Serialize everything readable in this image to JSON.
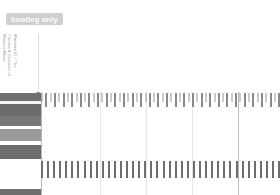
{
  "badge": {
    "label": "bootleg only",
    "bg_color": "#cfcfcf",
    "text_color": "#ffffff"
  },
  "event": {
    "line1": "Machina #1 / The",
    "line2": "Friends & Enemies of",
    "line3": "Modern Music",
    "stem_color": "#dcdcdc",
    "marker_color": "#9e9e9e"
  },
  "palette": {
    "background": "#ffffff",
    "gridline": "#e6e6e6",
    "gridline_major": "#b8b8b8",
    "tick_dark": "#6e6e6e",
    "tick_mid": "#9a9a9a",
    "tick_light": "#c8c8c8"
  },
  "swatches": [
    {
      "name": "swatch-1",
      "color": "#6f6f6f",
      "height": 8
    },
    {
      "name": "swatch-2",
      "color": "#f4f4f4",
      "height": 3
    },
    {
      "name": "swatch-3",
      "color": "#6b6b6b",
      "height": 12
    },
    {
      "name": "swatch-4",
      "color": "#777777",
      "height": 10
    },
    {
      "name": "swatch-5",
      "color": "#ffffff",
      "height": 3
    },
    {
      "name": "swatch-6",
      "color": "#9a9a9a",
      "height": 12
    },
    {
      "name": "swatch-7",
      "color": "#ffffff",
      "height": 4
    },
    {
      "name": "swatch-8",
      "color": "#6e6e6e",
      "height": 14
    },
    {
      "name": "swatch-9",
      "color": "#ffffff",
      "height": 30
    },
    {
      "name": "swatch-10",
      "color": "#6e6e6e",
      "height": 16
    }
  ],
  "gridlines": [
    {
      "x": 41,
      "major": true
    },
    {
      "x": 100,
      "major": false
    },
    {
      "x": 146,
      "major": false
    },
    {
      "x": 192,
      "major": false
    },
    {
      "x": 238,
      "major": true
    }
  ],
  "chart_data": {
    "type": "bar",
    "title": "",
    "xlabel": "",
    "ylabel": "",
    "grid": true,
    "legend": "none",
    "series": [
      {
        "name": "timeline-row-top",
        "tick_height": 14,
        "tick_color": "#8a8a8a",
        "values": [
          9,
          14,
          9,
          14,
          9,
          14,
          9,
          14,
          9,
          14,
          9,
          14,
          9,
          14,
          9,
          14,
          9,
          14,
          9,
          14,
          9,
          14,
          9,
          14,
          9,
          14,
          9,
          14,
          9,
          14,
          9,
          14,
          9,
          14,
          9,
          14,
          9,
          14,
          9,
          14,
          9,
          14,
          9,
          14,
          9,
          14,
          9,
          14,
          9,
          14,
          9,
          14,
          9,
          14,
          9,
          14
        ]
      },
      {
        "name": "timeline-row-bottom",
        "tick_height": 17,
        "tick_color": "#6e6e6e",
        "values": [
          17,
          17,
          17,
          17,
          17,
          17,
          17,
          17,
          17,
          17,
          17,
          17,
          17,
          17,
          17,
          17,
          17,
          17,
          17,
          17,
          17,
          17,
          17,
          17,
          17,
          17,
          17,
          17,
          17,
          17,
          17,
          17,
          17,
          17,
          17,
          17,
          17,
          17,
          17,
          17
        ]
      }
    ]
  }
}
